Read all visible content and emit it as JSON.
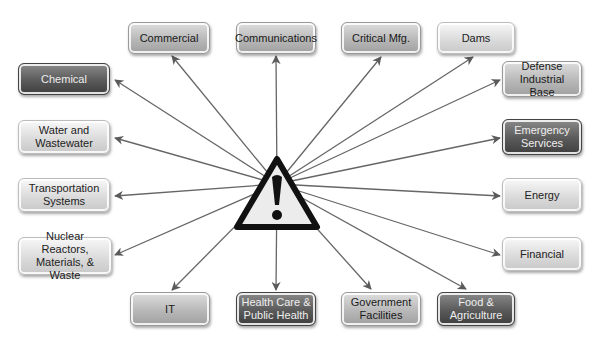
{
  "diagram": {
    "center": {
      "icon": "warning-triangle-icon",
      "symbol": "!"
    },
    "sectors": [
      {
        "id": "commercial",
        "label": "Commercial",
        "x": 128,
        "y": 22,
        "w": 82,
        "h": 32,
        "tone": "mid"
      },
      {
        "id": "communications",
        "label": "Communications",
        "x": 236,
        "y": 22,
        "w": 80,
        "h": 32,
        "tone": "mid"
      },
      {
        "id": "critical-mfg",
        "label": "Critical Mfg.",
        "x": 341,
        "y": 22,
        "w": 80,
        "h": 32,
        "tone": "mid"
      },
      {
        "id": "dams",
        "label": "Dams",
        "x": 437,
        "y": 22,
        "w": 78,
        "h": 32,
        "tone": "light"
      },
      {
        "id": "chemical",
        "label": "Chemical",
        "x": 18,
        "y": 63,
        "w": 92,
        "h": 32,
        "tone": "dark"
      },
      {
        "id": "defense-industrial-base",
        "label": "Defense Industrial Base",
        "x": 502,
        "y": 61,
        "w": 80,
        "h": 36,
        "tone": "mid"
      },
      {
        "id": "water-wastewater",
        "label": "Water and Wastewater",
        "x": 18,
        "y": 120,
        "w": 92,
        "h": 34,
        "tone": "light"
      },
      {
        "id": "emergency-services",
        "label": "Emergency Services",
        "x": 502,
        "y": 119,
        "w": 80,
        "h": 36,
        "tone": "dark"
      },
      {
        "id": "transportation",
        "label": "Transportation Systems",
        "x": 18,
        "y": 178,
        "w": 92,
        "h": 34,
        "tone": "light"
      },
      {
        "id": "energy",
        "label": "Energy",
        "x": 502,
        "y": 178,
        "w": 80,
        "h": 34,
        "tone": "light"
      },
      {
        "id": "nuclear",
        "label": "Nuclear Reactors, Materials, & Waste",
        "x": 18,
        "y": 237,
        "w": 94,
        "h": 38,
        "tone": "light"
      },
      {
        "id": "financial",
        "label": "Financial",
        "x": 502,
        "y": 237,
        "w": 80,
        "h": 34,
        "tone": "light"
      },
      {
        "id": "it",
        "label": "IT",
        "x": 130,
        "y": 292,
        "w": 80,
        "h": 34,
        "tone": "mid"
      },
      {
        "id": "health-care",
        "label": "Health Care & Public Health",
        "x": 236,
        "y": 292,
        "w": 80,
        "h": 34,
        "tone": "dark"
      },
      {
        "id": "government-facilities",
        "label": "Government Facilities",
        "x": 341,
        "y": 292,
        "w": 80,
        "h": 34,
        "tone": "mid"
      },
      {
        "id": "food-agriculture",
        "label": "Food & Agriculture",
        "x": 437,
        "y": 292,
        "w": 78,
        "h": 34,
        "tone": "dark"
      }
    ],
    "arrow_targets": [
      [
        172,
        56
      ],
      [
        276,
        56
      ],
      [
        381,
        57
      ],
      [
        473,
        57
      ],
      [
        115,
        80
      ],
      [
        500,
        80
      ],
      [
        115,
        138
      ],
      [
        500,
        138
      ],
      [
        115,
        196
      ],
      [
        500,
        196
      ],
      [
        115,
        255
      ],
      [
        500,
        255
      ],
      [
        172,
        290
      ],
      [
        276,
        290
      ],
      [
        371,
        289
      ],
      [
        466,
        289
      ]
    ],
    "origin": [
      277,
      184
    ],
    "line_color": "#666666"
  }
}
